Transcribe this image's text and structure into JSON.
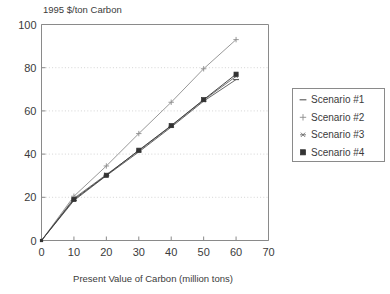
{
  "chart_data": {
    "type": "line",
    "title": "",
    "ylabel": "1995 $/ton Carbon",
    "xlabel": "Present Value of Carbon (million tons)",
    "xlim": [
      0,
      70
    ],
    "ylim": [
      0,
      100
    ],
    "xticks": [
      0,
      10,
      20,
      30,
      40,
      50,
      60,
      70
    ],
    "yticks": [
      0,
      20,
      40,
      60,
      80,
      100
    ],
    "xtick_labels": [
      "0",
      "10",
      "20",
      "30",
      "40",
      "50",
      "60",
      "70"
    ],
    "ytick_labels": [
      "0",
      "20",
      "40",
      "60",
      "80",
      "100"
    ],
    "grid": "horizontal-dotted",
    "legend_position": "right-outside",
    "x": [
      0,
      10,
      20,
      30,
      40,
      50,
      60
    ],
    "series": [
      {
        "name": "Scenario #1",
        "marker": "dash",
        "color": "#555555",
        "values": [
          0,
          18.5,
          30.0,
          41.0,
          52.5,
          64.5,
          74.5
        ]
      },
      {
        "name": "Scenario #2",
        "marker": "plus",
        "color": "#8c8c8c",
        "values": [
          0,
          20.5,
          34.5,
          49.5,
          64.0,
          79.5,
          93.0
        ]
      },
      {
        "name": "Scenario #3",
        "marker": "asterisk",
        "color": "#666666",
        "values": [
          0,
          19.5,
          30.5,
          41.5,
          53.0,
          65.0,
          76.0
        ]
      },
      {
        "name": "Scenario #4",
        "marker": "square",
        "color": "#333333",
        "values": [
          0,
          19.0,
          30.2,
          41.8,
          53.2,
          65.2,
          77.0
        ]
      }
    ]
  },
  "legend": {
    "items": [
      {
        "label": "Scenario #1"
      },
      {
        "label": "Scenario #2"
      },
      {
        "label": "Scenario #3"
      },
      {
        "label": "Scenario #4"
      }
    ]
  },
  "axes": {
    "y_axis_title": "1995 $/ton Carbon",
    "x_axis_title": "Present Value of Carbon (million tons)"
  }
}
